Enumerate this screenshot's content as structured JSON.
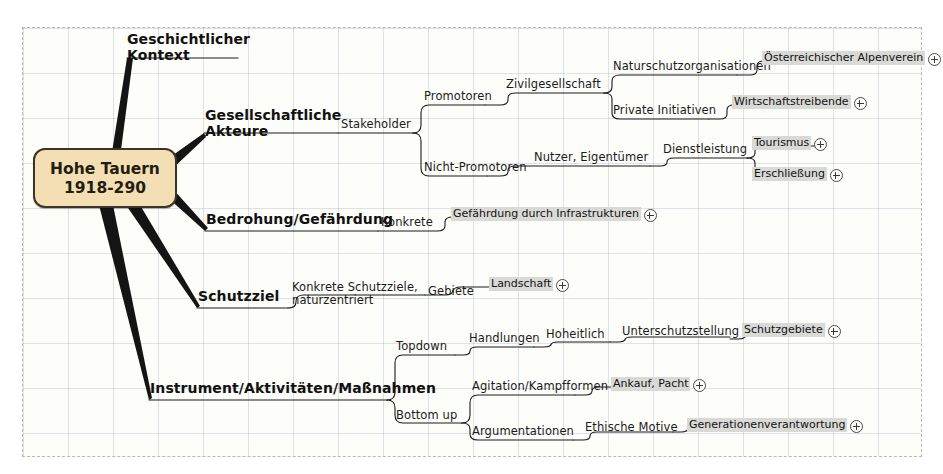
{
  "canvas": {
    "frame_style": "dashed",
    "grid": "dotted",
    "background": "#fdfdfa"
  },
  "root": {
    "line1": "Hohe Tauern",
    "line2": "1918-290",
    "fill": "#f3dfb3",
    "border": "#3a3327"
  },
  "branches": [
    {
      "label": "Geschichtlicher Kontext"
    },
    {
      "label": "Gesellschaftliche Akteure"
    },
    {
      "label": "Bedrohung/Gefährdung"
    },
    {
      "label": "Schutzziel"
    },
    {
      "label": "Instrument/Aktivitäten/Maßnahmen"
    }
  ],
  "nodes": {
    "stakeholder": "Stakeholder",
    "promotoren": "Promotoren",
    "nicht_promotoren": "Nicht-Promotoren",
    "zivilgesellschaft": "Zivilgesellschaft",
    "naturschutzorganisationen": "Naturschutzorganisationen",
    "private_initiativen": "Private Initiativen",
    "nutzer_eigentuemer": "Nutzer, Eigentümer",
    "dienstleistung": "Dienstleistung",
    "konkrete": "Konkrete",
    "konkrete_schutzziele": "Konkrete Schutzziele, naturzentriert",
    "gebiete": "Gebiete",
    "topdown": "Topdown",
    "bottom_up": "Bottom up",
    "handlungen": "Handlungen",
    "hoheitlich": "Hoheitlich",
    "unterschutzstellung": "Unterschutzstellung",
    "agitation_kampfformen": "Agitation/Kampfformen",
    "argumentationen": "Argumentationen",
    "ethische_motive": "Ethische Motive"
  },
  "leaves": [
    {
      "label": "Österreichischer Alpenverein"
    },
    {
      "label": "Wirtschaftstreibende"
    },
    {
      "label": "Tourismus"
    },
    {
      "label": "Erschließung"
    },
    {
      "label": "Gefährdung durch Infrastrukturen"
    },
    {
      "label": "Landschaft"
    },
    {
      "label": "Schutzgebiete"
    },
    {
      "label": "Ankauf, Pacht"
    },
    {
      "label": "Generationenverantwortung"
    }
  ],
  "icons": {
    "expand": "plus-circle-icon"
  },
  "colors": {
    "root_fill": "#f3dfb3",
    "leaf_highlight": "#d9d9d6",
    "line": "#1a1a1a",
    "text": "#141414"
  }
}
